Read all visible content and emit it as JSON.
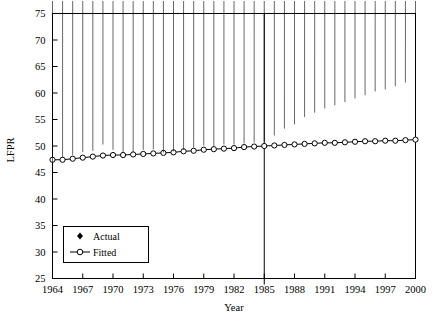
{
  "chart_data": {
    "type": "line",
    "title": "",
    "xlabel": "Year",
    "ylabel": "LFPR",
    "xlim": [
      1964,
      2000
    ],
    "ylim": [
      25,
      75
    ],
    "ytick_step": 5,
    "xtick_step": 3,
    "grid": false,
    "legend_position": "lower-left",
    "x": [
      1964,
      1965,
      1966,
      1967,
      1968,
      1969,
      1970,
      1971,
      1972,
      1973,
      1974,
      1975,
      1976,
      1977,
      1978,
      1979,
      1980,
      1981,
      1982,
      1983,
      1984,
      1985,
      1986,
      1987,
      1988,
      1989,
      1990,
      1991,
      1992,
      1993,
      1994,
      1995,
      1996,
      1997,
      1998,
      1999,
      2000
    ],
    "xticks": [
      1964,
      1967,
      1970,
      1973,
      1976,
      1979,
      1982,
      1985,
      1988,
      1991,
      1994,
      1997,
      2000
    ],
    "xtick_labels": [
      "1964",
      "1967",
      "1970",
      "1973",
      "1976",
      "1979",
      "1982",
      "1985",
      "1988",
      "1991",
      "1994",
      "1997",
      "2000"
    ],
    "yticks": [
      25,
      30,
      35,
      40,
      45,
      50,
      55,
      60,
      65,
      70,
      75
    ],
    "ytick_labels": [
      "25",
      "30",
      "35",
      "40",
      "45",
      "50",
      "55",
      "60",
      "65",
      "70",
      "75"
    ],
    "series": [
      {
        "name": "Actual",
        "marker": "filled-diamond",
        "line": false,
        "color": "#000000",
        "values": [
          46.1,
          47.2,
          47.6,
          48.2,
          48.4,
          49.6,
          48.6,
          48.1,
          48.2,
          48.6,
          48.7,
          48.1,
          48.3,
          48.6,
          49.0,
          49.4,
          49.2,
          49.6,
          49.6,
          49.8,
          50.0,
          50.2,
          51.3,
          52.6,
          53.4,
          54.8,
          55.6,
          56.4,
          57.0,
          57.6,
          58.3,
          58.9,
          59.6,
          60.0,
          60.6,
          61.3,
          61.5
        ]
      },
      {
        "name": "Fitted",
        "marker": "open-circle",
        "line": true,
        "color": "#000000",
        "values": [
          47.4,
          47.4,
          47.6,
          47.8,
          48.0,
          48.2,
          48.3,
          48.3,
          48.4,
          48.5,
          48.6,
          48.7,
          48.8,
          49.0,
          49.1,
          49.3,
          49.4,
          49.5,
          49.6,
          49.8,
          49.9,
          50.0,
          50.1,
          50.2,
          50.3,
          50.4,
          50.5,
          50.6,
          50.6,
          50.7,
          50.8,
          50.9,
          50.9,
          51.0,
          51.0,
          51.1,
          51.2
        ]
      }
    ],
    "reference_line": {
      "x": 1985,
      "orientation": "vertical",
      "label": ""
    }
  },
  "legend": {
    "items": [
      {
        "label": "Actual",
        "marker": "filled-diamond"
      },
      {
        "label": "Fitted",
        "marker": "open-circle-line"
      }
    ]
  },
  "axes": {
    "y_title": "LFPR",
    "x_title": "Year"
  }
}
